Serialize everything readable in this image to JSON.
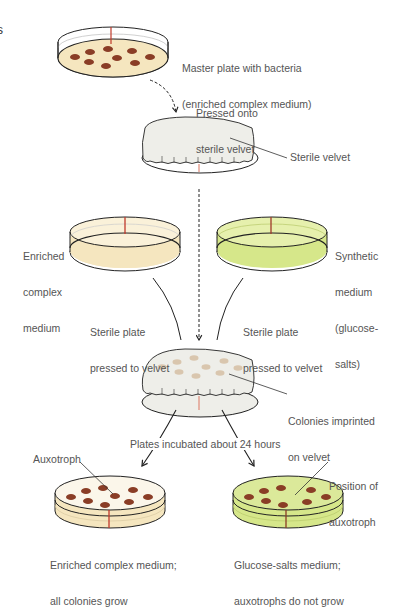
{
  "figure": {
    "letter_fragment": "s",
    "type": "replica plating procedure"
  },
  "colors": {
    "enriched_medium": "#f5e6bf",
    "enriched_medium_light": "#faf1d9",
    "synthetic_medium": "#d6e78a",
    "synthetic_medium_light": "#e6f0ad",
    "colony": "#8a3d26",
    "colony_imprint": "#d9c6ae",
    "velvet": "#eeeee9",
    "marker_line": "#c0392b",
    "outline": "#222222",
    "label_text": "#555555"
  },
  "steps": {
    "master_plate": {
      "label_line1": "Master plate with bacteria",
      "label_line2": "(enriched complex medium)"
    },
    "press_onto_velvet": {
      "label_line1": "Pressed onto",
      "label_line2": "sterile velvet"
    },
    "velvet": {
      "label": "Sterile velvet"
    },
    "enriched_plate": {
      "label_line1": "Enriched",
      "label_line2": "complex",
      "label_line3": "medium"
    },
    "synthetic_plate": {
      "label_line1": "Synthetic",
      "label_line2": "medium",
      "label_line3": "(glucose-",
      "label_line4": "salts)"
    },
    "left_press": {
      "label_line1": "Sterile plate",
      "label_line2": "pressed to velvet"
    },
    "right_press": {
      "label_line1": "Sterile plate",
      "label_line2": "pressed to velvet"
    },
    "imprinted_velvet": {
      "label_line1": "Colonies imprinted",
      "label_line2": "on velvet"
    },
    "incubation": {
      "label": "Plates incubated about 24 hours"
    },
    "result_enriched": {
      "callout": "Auxotroph",
      "caption_line1": "Enriched complex medium;",
      "caption_line2": "all colonies grow"
    },
    "result_synthetic": {
      "callout_line1": "Position of",
      "callout_line2": "auxotroph",
      "caption_line1": "Glucose-salts medium;",
      "caption_line2": "auxotrophs do not grow"
    }
  },
  "colonies": {
    "master_count": 9,
    "enriched_result_count": 9,
    "synthetic_result_count": 8,
    "missing_in_synthetic": "auxotroph (center colony)"
  }
}
